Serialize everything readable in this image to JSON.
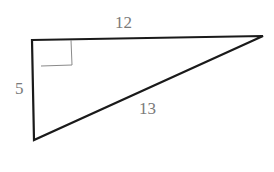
{
  "diagram": {
    "type": "right-triangle",
    "labels": {
      "top_side": "12",
      "left_side": "5",
      "hypotenuse": "13"
    },
    "right_angle_marker": true,
    "colors": {
      "stroke": "#1a1a1a",
      "label": "#7a7a7a",
      "marker": "#8a8a8a"
    }
  }
}
